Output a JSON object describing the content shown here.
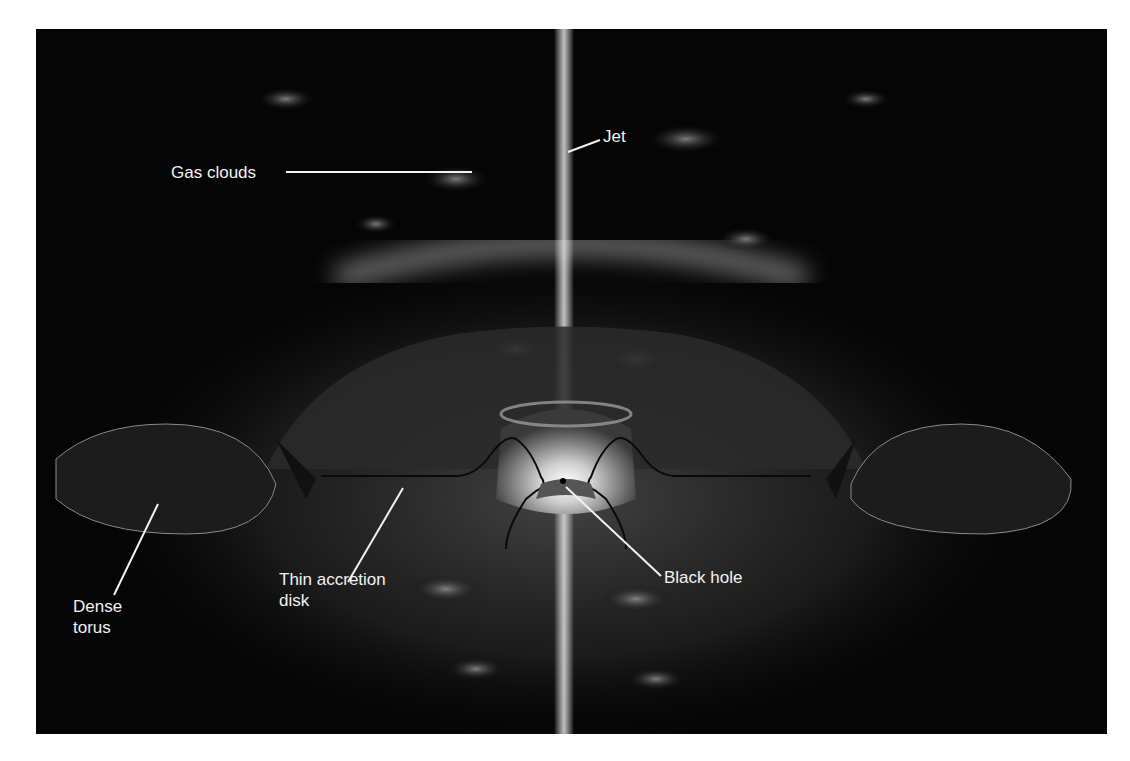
{
  "figure": {
    "background_color": "#050505",
    "labels": {
      "gas_clouds": "Gas clouds",
      "jet": "Jet",
      "dense_torus_line1": "Dense",
      "dense_torus_line2": "torus",
      "thin_disk_line1": "Thin accretion",
      "thin_disk_line2": "disk",
      "black_hole": "Black hole"
    }
  }
}
